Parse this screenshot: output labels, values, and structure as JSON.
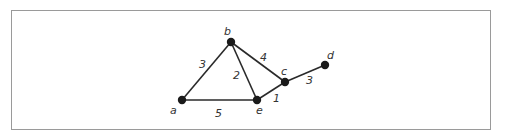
{
  "diagram": {
    "type": "weighted-undirected-graph",
    "nodes": [
      {
        "id": "a",
        "label": "a",
        "x": 182,
        "y": 100,
        "lx": 170,
        "ly": 114
      },
      {
        "id": "b",
        "label": "b",
        "x": 231,
        "y": 42,
        "lx": 224,
        "ly": 35
      },
      {
        "id": "c",
        "label": "c",
        "x": 285,
        "y": 82,
        "lx": 281,
        "ly": 75
      },
      {
        "id": "d",
        "label": "d",
        "x": 325,
        "y": 65,
        "lx": 327,
        "ly": 59
      },
      {
        "id": "e",
        "label": "e",
        "x": 257,
        "y": 100,
        "lx": 256,
        "ly": 114
      }
    ],
    "edges": [
      {
        "from": "a",
        "to": "b",
        "weight": "3",
        "lx": 199,
        "ly": 68
      },
      {
        "from": "a",
        "to": "e",
        "weight": "5",
        "lx": 215,
        "ly": 117
      },
      {
        "from": "b",
        "to": "e",
        "weight": "2",
        "lx": 233,
        "ly": 79
      },
      {
        "from": "b",
        "to": "c",
        "weight": "4",
        "lx": 260,
        "ly": 61
      },
      {
        "from": "e",
        "to": "c",
        "weight": "1",
        "lx": 273,
        "ly": 102
      },
      {
        "from": "c",
        "to": "d",
        "weight": "3",
        "lx": 306,
        "ly": 84
      }
    ]
  }
}
